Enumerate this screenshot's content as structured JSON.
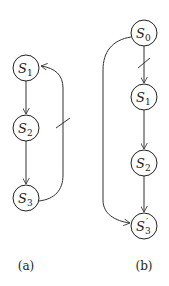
{
  "diagrams": [
    {
      "caption": "(a)",
      "nodes": [
        {
          "id": "S1",
          "base": "S",
          "sub": "1",
          "prime": ""
        },
        {
          "id": "S2",
          "base": "S",
          "sub": "2",
          "prime": ""
        },
        {
          "id": "S3",
          "base": "S",
          "sub": "3",
          "prime": ""
        }
      ],
      "edges": [
        {
          "from": "S1",
          "to": "S2",
          "cut": false
        },
        {
          "from": "S2",
          "to": "S3",
          "cut": false
        },
        {
          "from": "S3",
          "to": "S1",
          "cut": true
        }
      ]
    },
    {
      "caption": "(b)",
      "nodes": [
        {
          "id": "S0",
          "base": "S",
          "sub": "0",
          "prime": ""
        },
        {
          "id": "S1",
          "base": "S",
          "sub": "1",
          "prime": ""
        },
        {
          "id": "S2",
          "base": "S",
          "sub": "2",
          "prime": ""
        },
        {
          "id": "S3'",
          "base": "S",
          "sub": "3",
          "prime": "′"
        }
      ],
      "edges": [
        {
          "from": "S0",
          "to": "S1",
          "cut": true
        },
        {
          "from": "S1",
          "to": "S2",
          "cut": false
        },
        {
          "from": "S2",
          "to": "S3'",
          "cut": false
        },
        {
          "from": "S0",
          "to": "S3'",
          "cut": false
        }
      ]
    }
  ]
}
